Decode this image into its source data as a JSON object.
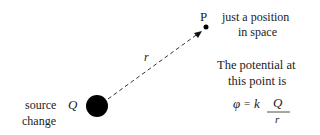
{
  "diagram": {
    "point_label": "P",
    "point_desc_line1": "just a position",
    "point_desc_line2": "in space",
    "distance_label": "r",
    "source_symbol": "Q",
    "source_label_line1": "source",
    "source_label_line2": "change",
    "potential_line1": "The potential at",
    "potential_line2": "this point is",
    "formula": {
      "lhs": "φ",
      "equals": "=",
      "constant": "k",
      "numerator": "Q",
      "denominator": "r"
    }
  }
}
